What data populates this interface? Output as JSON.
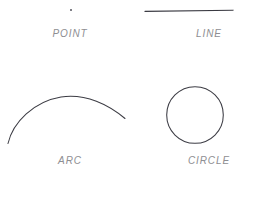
{
  "diagram": {
    "background_color": "#ffffff",
    "stroke_color": "#3a3a42",
    "label_color": "#8e8e92",
    "shapes": [
      {
        "id": "point",
        "label": "POINT",
        "icon": "point-dot-icon",
        "geometry": {
          "cx": 71,
          "cy": 10,
          "r": 1.0
        }
      },
      {
        "id": "line",
        "label": "LINE",
        "icon": "line-segment-icon",
        "geometry": {
          "x1": 6,
          "y1": 11,
          "x2": 94,
          "y2": 10
        }
      },
      {
        "id": "arc",
        "label": "ARC",
        "icon": "arc-curve-icon",
        "geometry": {
          "start_x": 8,
          "start_y": 58,
          "end_x": 125,
          "end_y": 33,
          "apex_x": 75,
          "apex_y": 11
        }
      },
      {
        "id": "circle",
        "label": "CIRCLE",
        "icon": "circle-outline-icon",
        "geometry": {
          "cx": 56,
          "cy": 30,
          "r": 28
        }
      }
    ]
  }
}
